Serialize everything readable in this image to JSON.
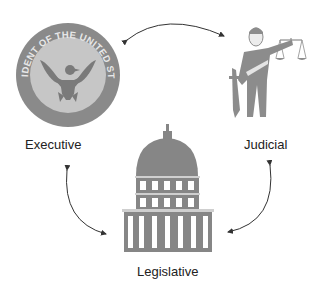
{
  "diagram": {
    "nodes": [
      {
        "id": "executive",
        "label": "Executive",
        "icon": "presidential-seal-icon"
      },
      {
        "id": "judicial",
        "label": "Judicial",
        "icon": "justice-figure-icon"
      },
      {
        "id": "legislative",
        "label": "Legislative",
        "icon": "capitol-building-icon"
      }
    ],
    "edges": [
      {
        "from": "executive",
        "to": "judicial",
        "type": "bidirectional"
      },
      {
        "from": "judicial",
        "to": "legislative",
        "type": "bidirectional"
      },
      {
        "from": "legislative",
        "to": "executive",
        "type": "bidirectional"
      }
    ],
    "seal_text": "PRESIDENT OF THE UNITED STATES",
    "colors": {
      "icon_gray": "#8a8a8a",
      "icon_light": "#c8c8c8",
      "arrow": "#333333",
      "text": "#222222"
    }
  }
}
